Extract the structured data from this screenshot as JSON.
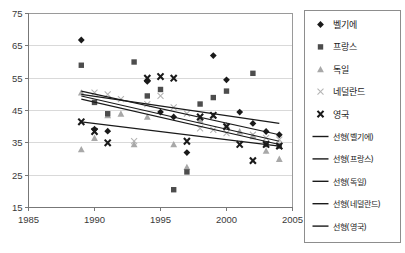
{
  "chart_data": {
    "type": "scatter",
    "title": "",
    "xlabel": "",
    "ylabel": "",
    "xlim": [
      1985,
      2005
    ],
    "ylim": [
      15,
      75
    ],
    "xticks": [
      1985,
      1990,
      1995,
      2000,
      2005
    ],
    "yticks": [
      15,
      25,
      35,
      45,
      55,
      65,
      75
    ],
    "grid": true,
    "legend_position": "right",
    "series": [
      {
        "name": "벨기에",
        "marker": "diamond",
        "color": "#1a1a1a",
        "points": [
          {
            "x": 1989,
            "y": 66.8
          },
          {
            "x": 1990,
            "y": 39.2
          },
          {
            "x": 1991,
            "y": 38.6
          },
          {
            "x": 1994,
            "y": 54.0
          },
          {
            "x": 1995,
            "y": 44.5
          },
          {
            "x": 1996,
            "y": 43.0
          },
          {
            "x": 1997,
            "y": 32.0
          },
          {
            "x": 1999,
            "y": 62.0
          },
          {
            "x": 2000,
            "y": 54.5
          },
          {
            "x": 2001,
            "y": 44.5
          },
          {
            "x": 2002,
            "y": 41.0
          },
          {
            "x": 2003,
            "y": 38.5
          },
          {
            "x": 2004,
            "y": 37.5
          }
        ]
      },
      {
        "name": "프랑스",
        "marker": "square",
        "color": "#4d4d4d",
        "points": [
          {
            "x": 1989,
            "y": 59.0
          },
          {
            "x": 1990,
            "y": 47.5
          },
          {
            "x": 1991,
            "y": 44.0
          },
          {
            "x": 1993,
            "y": 60.0
          },
          {
            "x": 1994,
            "y": 49.5
          },
          {
            "x": 1995,
            "y": 51.5
          },
          {
            "x": 1996,
            "y": 20.5
          },
          {
            "x": 1997,
            "y": 26.0
          },
          {
            "x": 1998,
            "y": 47.0
          },
          {
            "x": 1999,
            "y": 49.0
          },
          {
            "x": 2000,
            "y": 51.0
          },
          {
            "x": 2002,
            "y": 56.5
          },
          {
            "x": 2003,
            "y": 34.5
          },
          {
            "x": 2004,
            "y": 34.0
          }
        ]
      },
      {
        "name": "독일",
        "marker": "triangle",
        "color": "#a8a8a8",
        "points": [
          {
            "x": 1989,
            "y": 50.5
          },
          {
            "x": 1989,
            "y": 33.0
          },
          {
            "x": 1990,
            "y": 36.5
          },
          {
            "x": 1991,
            "y": 43.5
          },
          {
            "x": 1992,
            "y": 44.0
          },
          {
            "x": 1993,
            "y": 34.5
          },
          {
            "x": 1994,
            "y": 43.0
          },
          {
            "x": 1996,
            "y": 34.5
          },
          {
            "x": 1997,
            "y": 27.5
          },
          {
            "x": 1998,
            "y": 42.0
          },
          {
            "x": 1999,
            "y": 43.5
          },
          {
            "x": 2000,
            "y": 40.5
          },
          {
            "x": 2001,
            "y": 38.5
          },
          {
            "x": 2002,
            "y": 37.0
          },
          {
            "x": 2003,
            "y": 32.5
          },
          {
            "x": 2004,
            "y": 30.0
          }
        ]
      },
      {
        "name": "네덜란드",
        "marker": "x-light",
        "color": "#b5b5b5",
        "points": [
          {
            "x": 1990,
            "y": 50.5
          },
          {
            "x": 1991,
            "y": 50.0
          },
          {
            "x": 1992,
            "y": 48.5
          },
          {
            "x": 1993,
            "y": 35.5
          },
          {
            "x": 1994,
            "y": 47.0
          },
          {
            "x": 1995,
            "y": 49.5
          },
          {
            "x": 1996,
            "y": 46.0
          },
          {
            "x": 1997,
            "y": 44.0
          },
          {
            "x": 1998,
            "y": 39.5
          },
          {
            "x": 1999,
            "y": 39.0
          },
          {
            "x": 2000,
            "y": 38.0
          },
          {
            "x": 2002,
            "y": 37.5
          },
          {
            "x": 2003,
            "y": 36.5
          },
          {
            "x": 2004,
            "y": 36.0
          }
        ]
      },
      {
        "name": "영국",
        "marker": "x-bold",
        "color": "#1a1a1a",
        "points": [
          {
            "x": 1989,
            "y": 41.5
          },
          {
            "x": 1990,
            "y": 38.5
          },
          {
            "x": 1991,
            "y": 35.0
          },
          {
            "x": 1994,
            "y": 55.0
          },
          {
            "x": 1995,
            "y": 55.5
          },
          {
            "x": 1996,
            "y": 55.0
          },
          {
            "x": 1997,
            "y": 35.5
          },
          {
            "x": 1998,
            "y": 43.0
          },
          {
            "x": 1999,
            "y": 43.5
          },
          {
            "x": 2000,
            "y": 40.0
          },
          {
            "x": 2001,
            "y": 34.5
          },
          {
            "x": 2002,
            "y": 29.5
          },
          {
            "x": 2003,
            "y": 34.5
          },
          {
            "x": 2004,
            "y": 34.0
          }
        ]
      }
    ],
    "trendlines": [
      {
        "name": "선형(벨기에)",
        "color": "#1a1a1a",
        "x0": 1989,
        "y0": 48.5,
        "x1": 2004,
        "y1": 34.5
      },
      {
        "name": "선형(프랑스)",
        "color": "#1a1a1a",
        "x0": 1989,
        "y0": 49.5,
        "x1": 2004,
        "y1": 35.5
      },
      {
        "name": "선형(독일)",
        "color": "#1a1a1a",
        "x0": 1989,
        "y0": 41.5,
        "x1": 2004,
        "y1": 34.0
      },
      {
        "name": "선형(네덜란드)",
        "color": "#1a1a1a",
        "x0": 1989,
        "y0": 51.0,
        "x1": 2004,
        "y1": 37.5
      },
      {
        "name": "선형(영국)",
        "color": "#1a1a1a",
        "x0": 1989,
        "y0": 50.0,
        "x1": 2004,
        "y1": 41.0
      }
    ]
  },
  "legend": {
    "entries": [
      {
        "label": "벨기에",
        "marker": "diamond"
      },
      {
        "label": "프랑스",
        "marker": "square"
      },
      {
        "label": "독일",
        "marker": "triangle"
      },
      {
        "label": "네덜란드",
        "marker": "x-light"
      },
      {
        "label": "영국",
        "marker": "x-bold"
      },
      {
        "label": "선형(벨기에)",
        "marker": "line"
      },
      {
        "label": "선형(프랑스)",
        "marker": "line"
      },
      {
        "label": "선형(독일)",
        "marker": "line"
      },
      {
        "label": "선형(네덜란드)",
        "marker": "line"
      },
      {
        "label": "선형(영국)",
        "marker": "line"
      }
    ]
  },
  "colors": {
    "axis": "#808080",
    "grid": "#d9d9d9",
    "plot_background": "#ffffff",
    "text": "#3a3a3a"
  }
}
